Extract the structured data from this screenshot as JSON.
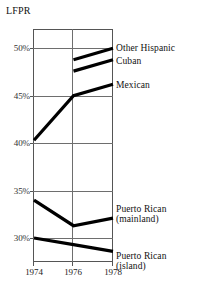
{
  "chart_data": {
    "type": "line",
    "title": "",
    "ylabel": "LFPR",
    "xlabel": "",
    "x": [
      1974,
      1976,
      1978
    ],
    "xtick_labels": [
      "1974",
      "1976",
      "1978"
    ],
    "ytick_labels": [
      "50%",
      "45%",
      "40%",
      "35%",
      "30%"
    ],
    "ytick_values": [
      50,
      45,
      40,
      35,
      30
    ],
    "ylim": [
      28.0,
      51.5
    ],
    "xlim": [
      1974,
      1978
    ],
    "grid": true,
    "legend_position": "right-inline-labels",
    "series": [
      {
        "name": "Other Hispanic",
        "label": "Other Hispanic",
        "x": [
          1976,
          1978
        ],
        "values": [
          48.8,
          50.0
        ]
      },
      {
        "name": "Cuban",
        "label": "Cuban",
        "x": [
          1976,
          1978
        ],
        "values": [
          47.6,
          48.8
        ]
      },
      {
        "name": "Mexican",
        "label": "Mexican",
        "x": [
          1974,
          1976,
          1978
        ],
        "values": [
          40.3,
          45.0,
          46.2
        ]
      },
      {
        "name": "Puerto Rican (mainland)",
        "label": "Puerto Rican",
        "sublabel": "(mainland)",
        "x": [
          1974,
          1976,
          1978
        ],
        "values": [
          34.0,
          31.3,
          32.1
        ]
      },
      {
        "name": "Puerto Rican (island)",
        "label": "Puerto Rican",
        "sublabel": "(island)",
        "x": [
          1974,
          1976,
          1978
        ],
        "values": [
          30.0,
          29.3,
          28.6
        ]
      }
    ]
  },
  "axis": {
    "y_title": "LFPR"
  },
  "ticks": {
    "y": [
      {
        "label": "50%"
      },
      {
        "label": "45%"
      },
      {
        "label": "40%"
      },
      {
        "label": "35%"
      },
      {
        "label": "30%"
      }
    ],
    "x": [
      {
        "label": "1974"
      },
      {
        "label": "1976"
      },
      {
        "label": "1978"
      }
    ]
  },
  "labels": {
    "other_hispanic": "Other Hispanic",
    "cuban": "Cuban",
    "mexican": "Mexican",
    "pr_mainland_line1": "Puerto Rican",
    "pr_mainland_line2": "(mainland)",
    "pr_island_line1": "Puerto Rican",
    "pr_island_line2": "(island)"
  },
  "colors": {
    "line": "#000000",
    "grid": "#6e6e6e",
    "frame": "#555555",
    "text": "#111111",
    "background": "#ffffff"
  }
}
